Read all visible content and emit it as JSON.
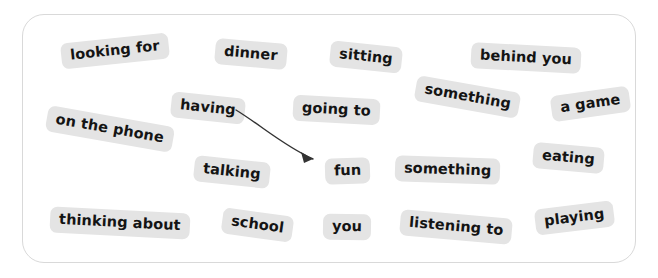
{
  "canvas": {
    "width": 658,
    "height": 278,
    "background": "#ffffff"
  },
  "panel": {
    "name": "word-bank-panel",
    "border_color": "#d9d9d9",
    "background": "#ffffff",
    "x": 22,
    "y": 14,
    "width": 614,
    "height": 249,
    "corner_radius": 22
  },
  "chip_style": {
    "background": "#e4e4e4",
    "text_color": "#141414"
  },
  "words": [
    {
      "label": "looking for",
      "x": 61,
      "y": 38,
      "rotate": -6
    },
    {
      "label": "dinner",
      "x": 215,
      "y": 41,
      "rotate": 5
    },
    {
      "label": "sitting",
      "x": 330,
      "y": 44,
      "rotate": 6
    },
    {
      "label": "behind you",
      "x": 471,
      "y": 45,
      "rotate": 3
    },
    {
      "label": "having",
      "x": 171,
      "y": 95,
      "rotate": 6
    },
    {
      "label": "going to",
      "x": 293,
      "y": 97,
      "rotate": 3
    },
    {
      "label": "something",
      "x": 415,
      "y": 84,
      "rotate": 10
    },
    {
      "label": "a game",
      "x": 551,
      "y": 91,
      "rotate": -8
    },
    {
      "label": "on the phone",
      "x": 46,
      "y": 116,
      "rotate": 10
    },
    {
      "label": "fun",
      "x": 325,
      "y": 158,
      "rotate": -2
    },
    {
      "label": "something",
      "x": 395,
      "y": 157,
      "rotate": 2
    },
    {
      "label": "eating",
      "x": 533,
      "y": 145,
      "rotate": 5
    },
    {
      "label": "talking",
      "x": 194,
      "y": 159,
      "rotate": 6
    },
    {
      "label": "thinking about",
      "x": 50,
      "y": 210,
      "rotate": 3
    },
    {
      "label": "school",
      "x": 222,
      "y": 212,
      "rotate": 8
    },
    {
      "label": "you",
      "x": 323,
      "y": 214,
      "rotate": 1
    },
    {
      "label": "listening to",
      "x": 400,
      "y": 214,
      "rotate": 5
    },
    {
      "label": "playing",
      "x": 535,
      "y": 205,
      "rotate": -7
    }
  ],
  "arrow": {
    "name": "having-to-fun-arrow",
    "color": "#333333",
    "stroke_width": 1.4,
    "path": "M 236 110 C 262 126, 284 146, 313 159",
    "head": "M 313 159 L 301 152 L 304 163 Z",
    "from": "having",
    "to": "fun"
  }
}
